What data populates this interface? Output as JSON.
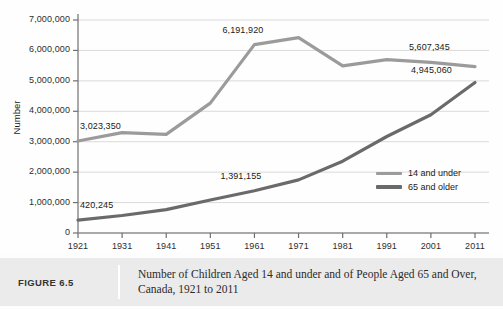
{
  "chart_data": {
    "type": "line",
    "title": "Number of Children Aged 14 and under and of People Aged 65 and Over, Canada, 1921 to 2011",
    "xlabel": "",
    "ylabel": "Number",
    "x": [
      1921,
      1931,
      1941,
      1951,
      1961,
      1971,
      1981,
      1991,
      2001,
      2011
    ],
    "xtick_labels": [
      "1921",
      "1931",
      "1941",
      "1951",
      "1961",
      "1971",
      "1981",
      "1991",
      "2001",
      "2011"
    ],
    "ytick_labels": [
      "0",
      "1,000,000",
      "2,000,000",
      "3,000,000",
      "4,000,000",
      "5,000,000",
      "6,000,000",
      "7,000,000"
    ],
    "ytick_values": [
      0,
      1000000,
      2000000,
      3000000,
      4000000,
      5000000,
      6000000,
      7000000
    ],
    "ylim": [
      0,
      7000000
    ],
    "grid": true,
    "legend_position": "inside-right",
    "series": [
      {
        "name": "14 and under",
        "color": "#9b9b9b",
        "values": [
          3023350,
          3300000,
          3240000,
          4270000,
          6191920,
          6420000,
          5490000,
          5700000,
          5607345,
          5470000
        ]
      },
      {
        "name": "65 and older",
        "color": "#6a6a6a",
        "values": [
          420245,
          576000,
          768000,
          1086000,
          1391155,
          1745000,
          2361000,
          3170000,
          3888000,
          4945060
        ]
      }
    ],
    "annotations": [
      {
        "text": "3,023,350",
        "series": "14 and under",
        "x": 1921,
        "value": 3023350
      },
      {
        "text": "6,191,920",
        "series": "14 and under",
        "x": 1961,
        "value": 6191920
      },
      {
        "text": "5,607,345",
        "series": "14 and under",
        "x": 2001,
        "value": 5607345
      },
      {
        "text": "420,245",
        "series": "65 and older",
        "x": 1921,
        "value": 420245
      },
      {
        "text": "1,391,155",
        "series": "65 and older",
        "x": 1961,
        "value": 1391155
      },
      {
        "text": "4,945,060",
        "series": "65 and older",
        "x": 2011,
        "value": 4945060
      }
    ]
  },
  "legend": {
    "items": [
      {
        "label": "14 and under",
        "color": "#9b9b9b"
      },
      {
        "label": "65 and older",
        "color": "#6a6a6a"
      }
    ]
  },
  "caption": {
    "number": "FIGURE 6.5",
    "text": "Number of Children Aged 14 and under and of People Aged 65 and Over, Canada, 1921 to 2011"
  }
}
